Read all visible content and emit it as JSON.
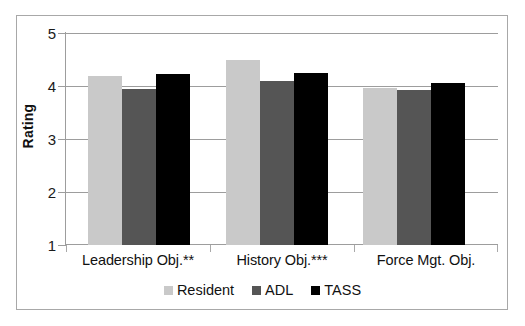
{
  "chart_data": {
    "type": "bar",
    "title": "",
    "xlabel": "",
    "ylabel": "Rating",
    "ylim": [
      1,
      5
    ],
    "yticks": [
      "1",
      "2",
      "3",
      "4",
      "5"
    ],
    "grid": true,
    "legend_position": "bottom",
    "categories": [
      "Leadership Obj.**",
      "History Obj.***",
      "Force Mgt. Obj."
    ],
    "series": [
      {
        "name": "Resident",
        "color": "#c9c9c9",
        "values": [
          4.19,
          4.5,
          3.97
        ]
      },
      {
        "name": "ADL",
        "color": "#555555",
        "values": [
          3.95,
          4.1,
          3.93
        ]
      },
      {
        "name": "TASS",
        "color": "#000000",
        "values": [
          4.22,
          4.25,
          4.05
        ]
      }
    ]
  },
  "axis": {
    "y_title": "Rating",
    "y_tick_5": "5",
    "y_tick_4": "4",
    "y_tick_3": "3",
    "y_tick_2": "2",
    "y_tick_1": "1"
  },
  "categories": {
    "cat_0": "Leadership Obj.**",
    "cat_1": "History Obj.***",
    "cat_2": "Force Mgt. Obj."
  },
  "legend": {
    "item_0": "Resident",
    "item_1": "ADL",
    "item_2": "TASS"
  }
}
